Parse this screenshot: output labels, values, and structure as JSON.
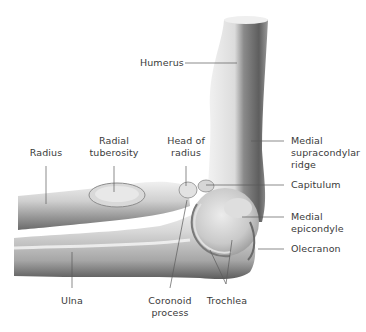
{
  "figure": {
    "colors": {
      "bone_light": "#e6e6e6",
      "bone_mid": "#bdbdbd",
      "bone_dark": "#6f6f6f",
      "leader_line": "#5a5a5a",
      "label_text": "#3a3a3a",
      "background": "#ffffff"
    }
  },
  "labels": {
    "humerus": "Humerus",
    "radius": "Radius",
    "radial_tuberosity_1": "Radial",
    "radial_tuberosity_2": "tuberosity",
    "head_of_radius_1": "Head of",
    "head_of_radius_2": "radius",
    "medial_supracondylar_1": "Medial",
    "medial_supracondylar_2": "supracondylar",
    "medial_supracondylar_3": "ridge",
    "capitulum": "Capitulum",
    "medial_epicondyle_1": "Medial",
    "medial_epicondyle_2": "epicondyle",
    "olecranon": "Olecranon",
    "ulna": "Ulna",
    "coronoid_process_1": "Coronoid",
    "coronoid_process_2": "process",
    "trochlea": "Trochlea"
  }
}
